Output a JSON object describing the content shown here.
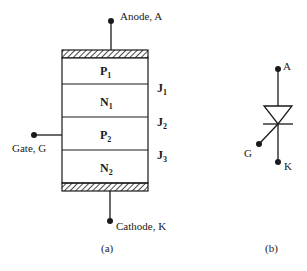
{
  "figure_a": {
    "caption": "(a)",
    "terminals": {
      "anode": "Anode, A",
      "gate": "Gate, G",
      "cathode": "Cathode, K"
    },
    "layers": [
      {
        "base": "P",
        "sub": "1"
      },
      {
        "base": "N",
        "sub": "1"
      },
      {
        "base": "P",
        "sub": "2"
      },
      {
        "base": "N",
        "sub": "2"
      }
    ],
    "junctions": [
      {
        "base": "J",
        "sub": "1"
      },
      {
        "base": "J",
        "sub": "2"
      },
      {
        "base": "J",
        "sub": "3"
      }
    ]
  },
  "figure_b": {
    "caption": "(b)",
    "terminals": {
      "anode": "A",
      "gate": "G",
      "cathode": "K"
    }
  },
  "colors": {
    "stroke": "#1a1a1a",
    "background": "#ffffff"
  }
}
